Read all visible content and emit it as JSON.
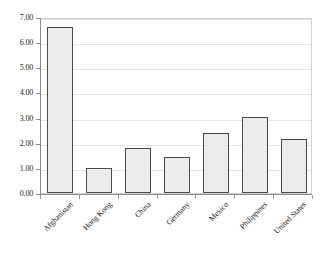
{
  "chart_data": {
    "type": "bar",
    "title": "",
    "subtitle": "",
    "xlabel": "",
    "ylabel": "",
    "categories": [
      "Afghanistan",
      "Hong Kong",
      "China",
      "Germany",
      "Mexico",
      "Philippines",
      "United States"
    ],
    "values": [
      6.6,
      1.0,
      1.8,
      1.42,
      2.4,
      3.03,
      2.15
    ],
    "ylim": [
      0.0,
      7.0
    ],
    "ytick_labels": [
      "0.00",
      "1.00",
      "2.00",
      "3.00",
      "4.00",
      "5.00",
      "6.00",
      "7.00"
    ],
    "ytick_values": [
      0,
      1,
      2,
      3,
      4,
      5,
      6,
      7
    ],
    "grid": "horizontal",
    "legend": "none",
    "bar_fill_color": "#ececec",
    "bar_border_color": "#4a4a4a",
    "gridline_color": "#e3e3e3",
    "axis_color": "#8a8a8a",
    "plot_border_color": "#d2d2d2",
    "background_color": "#ffffff",
    "xlabel_rotation": "-45"
  }
}
